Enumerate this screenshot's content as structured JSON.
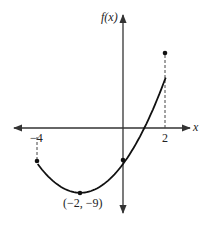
{
  "chart_data": {
    "type": "line",
    "title": "",
    "xlabel": "x",
    "ylabel": "f(x)",
    "function": "f(x) = x^2 + 4x - 5",
    "domain": [
      -4,
      2
    ],
    "x": [
      -4,
      -3,
      -2,
      -1,
      0,
      1,
      2
    ],
    "y": [
      -5,
      -8,
      -9,
      -8,
      -5,
      0,
      7
    ],
    "x_tick_labels": [
      "-4",
      "2"
    ],
    "annotations": [
      {
        "label": "(−2,  −9)",
        "x": -2,
        "y": -9,
        "type": "vertex"
      }
    ],
    "endpoints": [
      {
        "x": -4,
        "y": -5
      },
      {
        "x": 2,
        "y": 7
      }
    ],
    "grid": false,
    "legend": null
  },
  "labels": {
    "y_axis": "f(x)",
    "x_axis": "x",
    "tick_left": "−4",
    "tick_right": "2",
    "vertex": "(−2,  −9)"
  },
  "colors": {
    "curve": "#111111",
    "axes": "#333333",
    "dashed": "#444444"
  }
}
